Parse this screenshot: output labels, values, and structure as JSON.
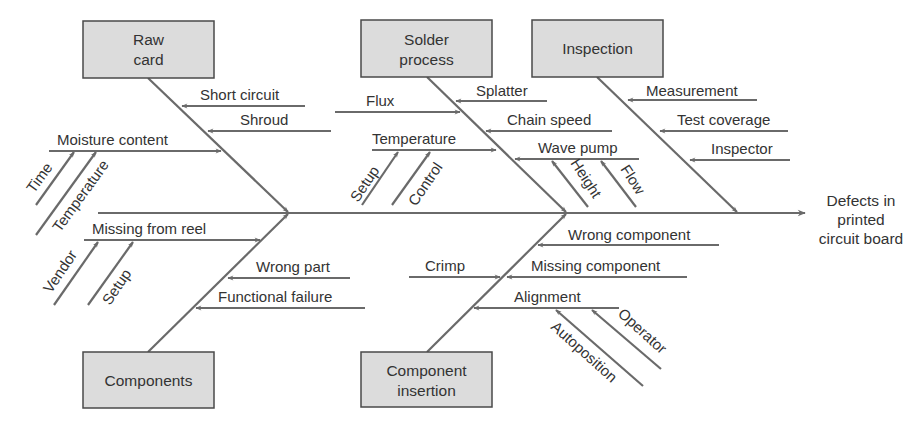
{
  "effect": {
    "lines": [
      "Defects in",
      "printed",
      "circuit board"
    ]
  },
  "categories": {
    "raw_card": {
      "lines": [
        "Raw",
        "card"
      ]
    },
    "solder_process": {
      "lines": [
        "Solder",
        "process"
      ]
    },
    "inspection": {
      "lines": [
        "Inspection"
      ]
    },
    "components": {
      "lines": [
        "Components"
      ]
    },
    "component_insertion": {
      "lines": [
        "Component",
        "insertion"
      ]
    }
  },
  "causes": {
    "raw_card": {
      "short_circuit": "Short circuit",
      "shroud": "Shroud",
      "moisture_content": "Moisture content",
      "moisture_sub": {
        "time": "Time",
        "temperature": "Temperature"
      }
    },
    "components": {
      "missing_from_reel": "Missing from reel",
      "missing_sub": {
        "vendor": "Vendor",
        "setup": "Setup"
      },
      "wrong_part": "Wrong part",
      "functional_failure": "Functional failure"
    },
    "solder_process": {
      "flux": "Flux",
      "splatter": "Splatter",
      "chain_speed": "Chain speed",
      "temperature": "Temperature",
      "temperature_sub": {
        "setup": "Setup",
        "control": "Control"
      },
      "wave_pump": "Wave pump",
      "wave_pump_sub": {
        "height": "Height",
        "flow": "Flow"
      }
    },
    "component_insertion": {
      "wrong_component": "Wrong component",
      "crimp": "Crimp",
      "missing_component": "Missing component",
      "alignment": "Alignment",
      "alignment_sub": {
        "autoposition": "Autoposition",
        "operator": "Operator"
      }
    },
    "inspection": {
      "measurement": "Measurement",
      "test_coverage": "Test coverage",
      "inspector": "Inspector"
    }
  },
  "colors": {
    "line": "#6a6a6a",
    "box_fill": "#dcdcdc",
    "box_stroke": "#4a4a4a",
    "text": "#333333"
  }
}
